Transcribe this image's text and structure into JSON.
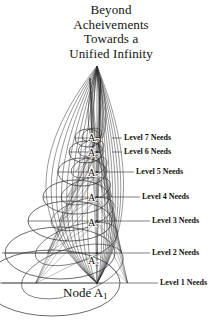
{
  "title": {
    "line1": "Beyond",
    "line2": "Acheivements",
    "line3": "Towards a",
    "line4": "Unified Infinity"
  },
  "base_node": {
    "text": "Node A",
    "subscript": "1"
  },
  "axis_nodes": [
    {
      "label": "A",
      "subscript": "7",
      "x": 88,
      "y": 133
    },
    {
      "label": "A",
      "subscript": "6",
      "x": 88,
      "y": 148
    },
    {
      "label": "A",
      "subscript": "5",
      "x": 88,
      "y": 168
    },
    {
      "label": "A",
      "subscript": "4",
      "x": 88,
      "y": 193
    },
    {
      "label": "A",
      "subscript": "3",
      "x": 88,
      "y": 218
    },
    {
      "label": "A",
      "subscript": "2",
      "x": 88,
      "y": 256
    }
  ],
  "level_labels": [
    {
      "text": "Level 7 Needs",
      "x": 124,
      "y": 134,
      "leader_x1": 112,
      "leader_x2": 122,
      "leader_y": 138
    },
    {
      "text": "Level 6 Needs",
      "x": 124,
      "y": 148,
      "leader_x1": 112,
      "leader_x2": 122,
      "leader_y": 152
    },
    {
      "text": "Level 5 Needs",
      "x": 136,
      "y": 168,
      "leader_x1": 104,
      "leader_x2": 134,
      "leader_y": 172
    },
    {
      "text": "Level 4 Needs",
      "x": 142,
      "y": 193,
      "leader_x1": 100,
      "leader_x2": 140,
      "leader_y": 197
    },
    {
      "text": "Level 3 Needs",
      "x": 152,
      "y": 217,
      "leader_x1": 96,
      "leader_x2": 150,
      "leader_y": 221
    },
    {
      "text": "Level 2 Needs",
      "x": 152,
      "y": 249,
      "leader_x1": 2,
      "leader_x2": 150,
      "leader_y": 253
    },
    {
      "text": "Level 1 Needs",
      "x": 160,
      "y": 279,
      "leader_x1": 2,
      "leader_x2": 158,
      "leader_y": 283
    }
  ],
  "figure": {
    "axis_x": 97,
    "apex_y": 66,
    "base_y": 283,
    "line_color": "#2b2b2b",
    "ink_color": "#111111",
    "background": "#ffffff",
    "tiers": [
      {
        "level": 7,
        "cy": 138,
        "rx": 13,
        "ry": 9,
        "cx": 88
      },
      {
        "level": 6,
        "cy": 152,
        "rx": 17,
        "ry": 11,
        "cx": 86
      },
      {
        "level": 5,
        "cy": 172,
        "rx": 24,
        "ry": 14,
        "cx": 82
      },
      {
        "level": 4,
        "cy": 197,
        "rx": 33,
        "ry": 17,
        "cx": 76
      },
      {
        "level": 3,
        "cy": 221,
        "rx": 42,
        "ry": 20,
        "cx": 70
      },
      {
        "level": 2,
        "cy": 253,
        "rx": 55,
        "ry": 26,
        "cx": 60
      },
      {
        "level": 1,
        "cy": 283,
        "rx": 68,
        "ry": 33,
        "cx": 52
      }
    ]
  }
}
